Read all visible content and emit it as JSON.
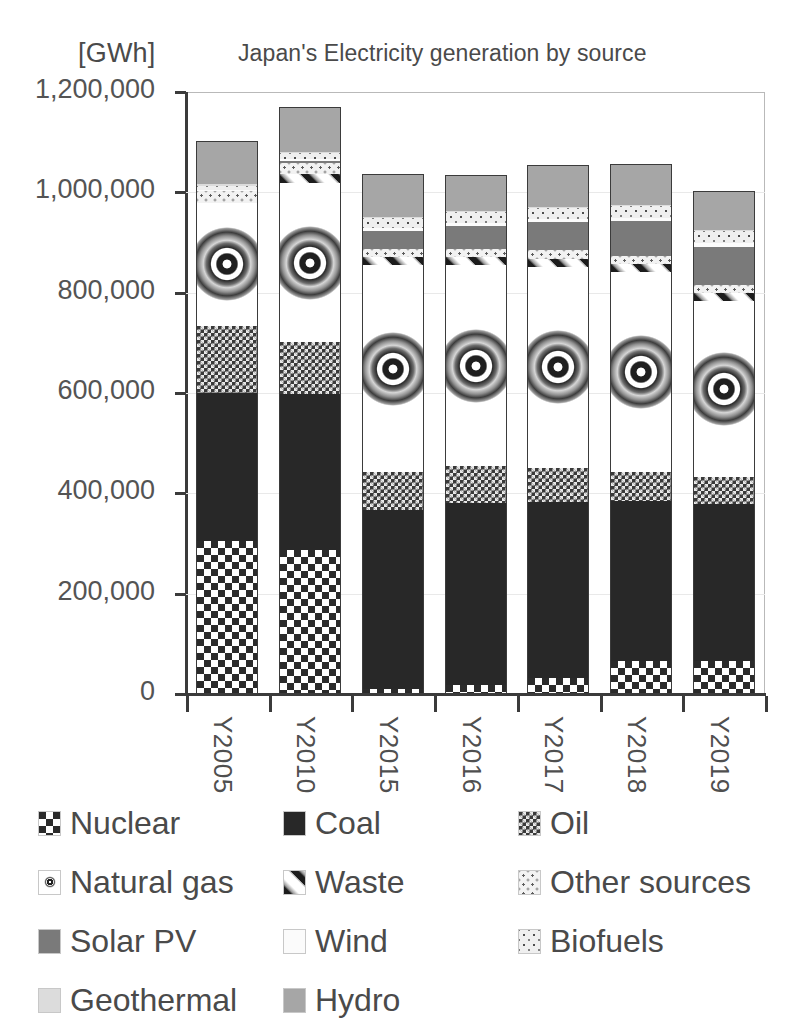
{
  "chart_data": {
    "type": "bar",
    "subtype": "stacked",
    "title": "Japan's Electricity generation by source",
    "unit_label": "[GWh]",
    "xlabel": "",
    "ylabel": "",
    "ylim": [
      0,
      1200000
    ],
    "ytick_step": 200000,
    "grid": true,
    "legend_position": "bottom",
    "categories": [
      "Y2005",
      "Y2010",
      "Y2015",
      "Y2016",
      "Y2017",
      "Y2018",
      "Y2019"
    ],
    "ytick_labels": [
      "1,200,000",
      "1,000,000",
      "800,000",
      "600,000",
      "400,000",
      "200,000",
      "0"
    ],
    "ytick_values": [
      1200000,
      1000000,
      800000,
      600000,
      400000,
      200000,
      0
    ],
    "series": [
      {
        "name": "Nuclear",
        "pattern": "checkerboard-large",
        "color": "#2b2b2b",
        "values": [
          304000,
          288000,
          9400,
          18000,
          31300,
          65000,
          65800
        ]
      },
      {
        "name": "Coal",
        "pattern": "solid-dark",
        "color": "#282828",
        "values": [
          296000,
          310000,
          357000,
          363000,
          351000,
          320000,
          312000
        ]
      },
      {
        "name": "Oil",
        "pattern": "checkerboard-fine",
        "color": "#3a3a3a",
        "values": [
          134000,
          103000,
          76000,
          73000,
          69000,
          58000,
          55000
        ]
      },
      {
        "name": "Natural gas",
        "pattern": "white-circle",
        "color": "#ffffff",
        "values": [
          245000,
          318000,
          412000,
          401000,
          400000,
          398000,
          350000
        ]
      },
      {
        "name": "Waste",
        "pattern": "diagonal-stripe",
        "color": "#ffffff",
        "values": [
          0,
          17000,
          16000,
          16000,
          16000,
          16000,
          16000
        ]
      },
      {
        "name": "Other sources",
        "pattern": "dotted-light",
        "color": "#f2f2f2",
        "values": [
          24000,
          22000,
          17000,
          17000,
          17000,
          17000,
          17000
        ]
      },
      {
        "name": "Solar PV",
        "pattern": "solid-gray",
        "color": "#7a7a7a",
        "values": [
          0,
          3800,
          35000,
          45000,
          56000,
          68000,
          75000
        ]
      },
      {
        "name": "Wind",
        "pattern": "solid-white",
        "color": "#fbfbfb",
        "values": [
          1700,
          4000,
          5600,
          6100,
          6500,
          7000,
          7500
        ]
      },
      {
        "name": "Biofuels",
        "pattern": "dotted-mid",
        "color": "#efefef",
        "values": [
          8000,
          12000,
          20000,
          21000,
          22000,
          23000,
          24000
        ]
      },
      {
        "name": "Geothermal",
        "pattern": "solid-pale",
        "color": "#dcdcdc",
        "values": [
          3200,
          2600,
          2600,
          2500,
          2500,
          2500,
          2500
        ]
      },
      {
        "name": "Hydro",
        "pattern": "solid-medium-gray",
        "color": "#a6a6a6",
        "values": [
          86000,
          90000,
          85000,
          72000,
          84000,
          81000,
          77000
        ]
      }
    ],
    "totals": [
      1101900,
      1170400,
      1035600,
      1034600,
      1055300,
      1055500,
      1001800
    ]
  },
  "legend": {
    "rows": [
      [
        {
          "label": "Nuclear",
          "swatch": "p-nuclear"
        },
        {
          "label": "Coal",
          "swatch": "p-coal"
        },
        {
          "label": "Oil",
          "swatch": "p-oil"
        }
      ],
      [
        {
          "label": "Natural gas",
          "swatch": "p-gas"
        },
        {
          "label": "Waste",
          "swatch": "p-waste"
        },
        {
          "label": "Other sources",
          "swatch": "p-other"
        }
      ],
      [
        {
          "label": "Solar PV",
          "swatch": "p-solar"
        },
        {
          "label": "Wind",
          "swatch": "p-wind"
        },
        {
          "label": "Biofuels",
          "swatch": "p-biofuel"
        }
      ],
      [
        {
          "label": "Geothermal",
          "swatch": "p-geo"
        },
        {
          "label": "Hydro",
          "swatch": "p-hydro"
        }
      ]
    ]
  }
}
